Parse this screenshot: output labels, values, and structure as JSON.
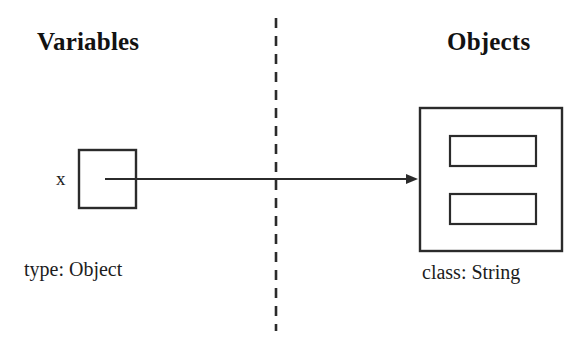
{
  "diagram": {
    "background_color": "#ffffff",
    "stroke_color": "#2b2b2b",
    "columns": {
      "left_heading": "Variables",
      "right_heading": "Objects"
    },
    "divider": {
      "style": "dashed",
      "orientation": "vertical",
      "x": 276,
      "y_start": 18,
      "y_end": 331,
      "dash_length": 10,
      "gap_length": 8
    },
    "variable": {
      "name": "x",
      "caption": "type: Object",
      "box": {
        "x": 78,
        "y": 149,
        "width": 58,
        "height": 59
      }
    },
    "object": {
      "caption": "class: String",
      "box": {
        "x": 419,
        "y": 107,
        "width": 143,
        "height": 144
      },
      "fields": [
        {
          "x": 449,
          "y": 135,
          "width": 87,
          "height": 31
        },
        {
          "x": 449,
          "y": 193,
          "width": 87,
          "height": 31
        }
      ]
    },
    "reference_arrow": {
      "from_x": 105,
      "from_y": 179,
      "to_x": 419,
      "to_y": 179,
      "head": "solid-triangle"
    }
  }
}
